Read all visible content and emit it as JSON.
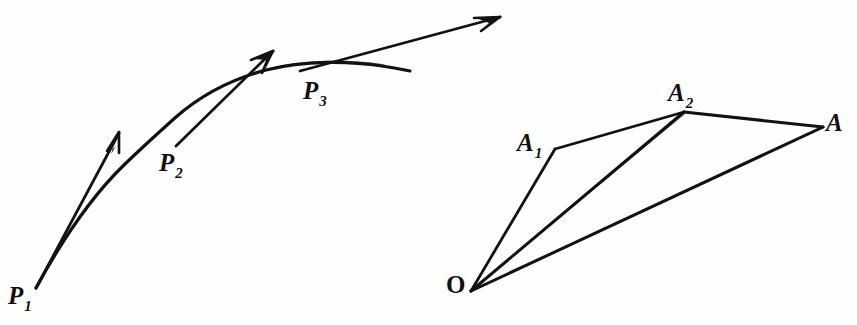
{
  "figure": {
    "background_color": "#fefefe",
    "ink_color": "#121212",
    "width": 857,
    "height": 325
  },
  "left_diagram": {
    "name": "curve-with-tangent-vectors",
    "points": [
      {
        "id": "P1",
        "base": "P",
        "sub": "1",
        "label_x": 8,
        "label_y": 283,
        "vertex_x": 36,
        "vertex_y": 288
      },
      {
        "id": "P2",
        "base": "P",
        "sub": "2",
        "label_x": 159,
        "label_y": 150,
        "vertex_x": 176,
        "vertex_y": 145
      },
      {
        "id": "P3",
        "base": "P",
        "sub": "3",
        "label_x": 303,
        "label_y": 78,
        "vertex_x": 302,
        "vertex_y": 69
      }
    ],
    "curve": {
      "id": "trajectory-curve",
      "start_x": 36,
      "start_y": 288,
      "end_x": 410,
      "end_y": 71
    },
    "vectors": [
      {
        "id": "tangent-vector-1",
        "from_x": 36,
        "from_y": 288,
        "to_x": 119,
        "to_y": 131
      },
      {
        "id": "tangent-vector-2",
        "from_x": 176,
        "from_y": 146,
        "to_x": 273,
        "to_y": 50
      },
      {
        "id": "tangent-vector-3",
        "from_x": 300,
        "from_y": 71,
        "to_x": 500,
        "to_y": 16
      }
    ]
  },
  "right_diagram": {
    "name": "vector-addition-polygon",
    "points": [
      {
        "id": "O",
        "base": "O",
        "sub": "",
        "label_x": 446,
        "label_y": 272,
        "vertex_x": 471,
        "vertex_y": 291,
        "upright": true
      },
      {
        "id": "A1",
        "base": "A",
        "sub": "1",
        "label_x": 517,
        "label_y": 130,
        "vertex_x": 555,
        "vertex_y": 149,
        "upright": false
      },
      {
        "id": "A2",
        "base": "A",
        "sub": "2",
        "label_x": 668,
        "label_y": 80,
        "vertex_x": 684,
        "vertex_y": 112,
        "upright": false
      },
      {
        "id": "A",
        "base": "A",
        "sub": "",
        "label_x": 826,
        "label_y": 110,
        "vertex_x": 823,
        "vertex_y": 127,
        "upright": false
      }
    ],
    "segments": [
      {
        "id": "segment-O-A1",
        "from": "O",
        "to": "A1"
      },
      {
        "id": "segment-A1-A2",
        "from": "A1",
        "to": "A2"
      },
      {
        "id": "segment-O-A2",
        "from": "O",
        "to": "A2"
      },
      {
        "id": "segment-A2-A",
        "from": "A2",
        "to": "A"
      },
      {
        "id": "segment-O-A",
        "from": "O",
        "to": "A"
      }
    ]
  }
}
